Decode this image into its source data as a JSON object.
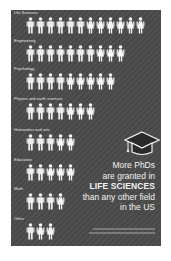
{
  "chart_data": {
    "type": "pictogram",
    "title": "More PhDs are granted in LIFE SCIENCES than any other field in the US",
    "categories": [
      "Life Sciences",
      "Engineering",
      "Psychology",
      "Physics and earth sciences",
      "Humanities and arts",
      "Education",
      "Math",
      "Other"
    ],
    "series": [
      {
        "name": "male",
        "values": [
          6,
          7,
          4,
          4,
          3,
          2,
          3,
          1
        ]
      },
      {
        "name": "female",
        "values": [
          6,
          3,
          5,
          3,
          2,
          3,
          1,
          2
        ]
      }
    ],
    "totals": [
      12,
      10,
      9,
      7,
      5,
      5,
      4,
      3
    ],
    "legend": "none",
    "grid": false
  },
  "rows": [
    {
      "label": "Life Sciences",
      "male": 6,
      "female": 6
    },
    {
      "label": "Engineering",
      "male": 7,
      "female": 3
    },
    {
      "label": "Psychology",
      "male": 4,
      "female": 5
    },
    {
      "label": "Physics and earth sciences",
      "male": 4,
      "female": 3
    },
    {
      "label": "Humanities and arts",
      "male": 3,
      "female": 2
    },
    {
      "label": "Education",
      "male": 2,
      "female": 3
    },
    {
      "label": "Math",
      "male": 3,
      "female": 1
    },
    {
      "label": "Other",
      "male": 1,
      "female": 2
    }
  ],
  "message": {
    "line1": "More PhDs",
    "line2": "are granted in",
    "line3": "LIFE SCIENCES",
    "line4": "than any other field",
    "line5": "in the US"
  },
  "icons": {
    "male": "person-male-icon",
    "female": "person-female-icon",
    "cap": "graduation-cap-icon"
  },
  "colors": {
    "panel": "#4a4a4a",
    "figure": "#ededed",
    "text": "#f2f2f2"
  }
}
